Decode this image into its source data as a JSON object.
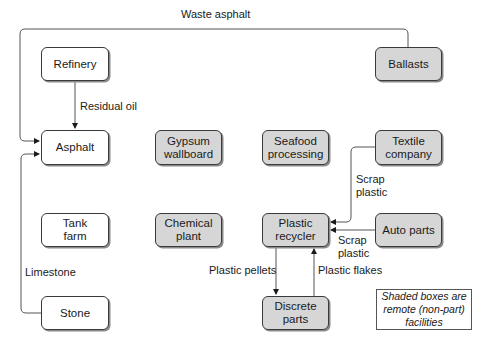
{
  "diagram": {
    "nodes": {
      "refinery": {
        "label": "Refinery",
        "shaded": false
      },
      "asphalt": {
        "label": "Asphalt",
        "shaded": false
      },
      "gypsum": {
        "label": "Gypsum\nwallboard",
        "shaded": true
      },
      "seafood": {
        "label": "Seafood\nprocessing",
        "shaded": true
      },
      "textile": {
        "label": "Textile\ncompany",
        "shaded": true
      },
      "ballasts": {
        "label": "Ballasts",
        "shaded": true
      },
      "tank_farm": {
        "label": "Tank\nfarm",
        "shaded": false
      },
      "chemical": {
        "label": "Chemical\nplant",
        "shaded": true
      },
      "plastic_recycler": {
        "label": "Plastic\nrecycler",
        "shaded": true
      },
      "auto_parts": {
        "label": "Auto parts",
        "shaded": true
      },
      "stone": {
        "label": "Stone",
        "shaded": false
      },
      "discrete_parts": {
        "label": "Discrete\nparts",
        "shaded": true
      }
    },
    "edges": {
      "waste_asphalt": {
        "from": "Ballasts",
        "to": "Asphalt",
        "label": "Waste asphalt"
      },
      "residual_oil": {
        "from": "Refinery",
        "to": "Asphalt",
        "label": "Residual oil"
      },
      "limestone": {
        "from": "Stone",
        "to": "Asphalt",
        "label": "Limestone"
      },
      "scrap_plastic_textile": {
        "from": "Textile company",
        "to": "Plastic recycler",
        "label": "Scrap\nplastic"
      },
      "scrap_plastic_auto": {
        "from": "Auto parts",
        "to": "Plastic recycler",
        "label": "Scrap\nplastic"
      },
      "plastic_pellets": {
        "from": "Plastic recycler",
        "to": "Discrete parts",
        "label": "Plastic pellets"
      },
      "plastic_flakes": {
        "from": "Discrete parts",
        "to": "Plastic recycler",
        "label": "Plastic flakes"
      }
    },
    "legend": {
      "text": "Shaded boxes are\nremote (non-part)\nfacilities"
    },
    "colors": {
      "shaded_fill": "#d6d6d6",
      "plain_fill": "#ffffff",
      "stroke": "#3a3a3a"
    }
  }
}
